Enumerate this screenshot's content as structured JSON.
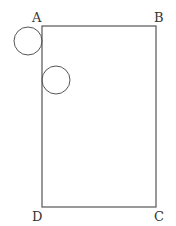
{
  "diagram": {
    "type": "geometry",
    "rectangle": {
      "vertices": {
        "A": {
          "label": "A",
          "x": 42,
          "y": 26
        },
        "B": {
          "label": "B",
          "x": 156,
          "y": 26
        },
        "C": {
          "label": "C",
          "x": 156,
          "y": 207
        },
        "D": {
          "label": "D",
          "x": 42,
          "y": 207
        }
      }
    },
    "circles": [
      {
        "name": "circle-at-A",
        "cx": 28,
        "cy": 41,
        "r": 14,
        "note": "tangent to side AD"
      },
      {
        "name": "circle-inside",
        "cx": 56,
        "cy": 80,
        "r": 14,
        "note": "tangent to side AD, inside rectangle"
      }
    ],
    "stroke_color": "#555555",
    "label_color": "#333333"
  }
}
